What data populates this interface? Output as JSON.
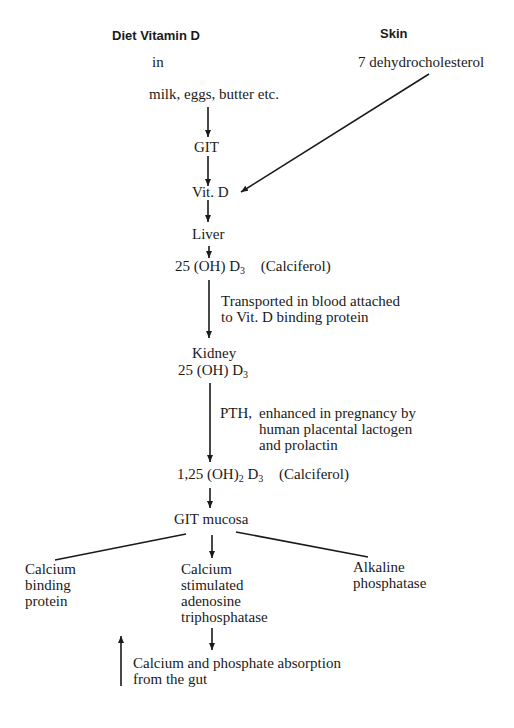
{
  "diagram": {
    "headers": {
      "diet": "Diet Vitamin D",
      "skin": "Skin"
    },
    "sources": {
      "in": "in",
      "foods": "milk, eggs, butter etc.",
      "skin_precursor": "7 dehydrocholesterol"
    },
    "nodes": {
      "git": "GIT",
      "vitd": "Vit. D",
      "liver": "Liver",
      "calcifediol_main": "25 (OH) D",
      "calcifediol_sub": "3",
      "calcifediol_note": "(Calciferol)",
      "kidney": "Kidney",
      "kidney_compound_main": "25 (OH) D",
      "kidney_compound_sub": "3",
      "calcitriol_prefix": "1,25 (OH)",
      "calcitriol_sub1": "2",
      "calcitriol_mid": " D",
      "calcitriol_sub2": "3",
      "calcitriol_note": "(Calciferol)",
      "git_mucosa": "GIT mucosa",
      "cbp": "Calcium\nbinding\nprotein",
      "atpase": "Calcium\nstimulated\nadenosine\ntriphosphatase",
      "alp": "Alkaline\nphosphatase",
      "absorption": "Calcium and phosphate absorption\nfrom the gut"
    },
    "edge_labels": {
      "transport": "Transported in blood attached\nto Vit. D binding protein",
      "pth": "PTH,",
      "pth_detail": "enhanced in pregnancy by\nhuman placental lactogen\nand prolactin"
    },
    "colors": {
      "ink": "#1a1a1a",
      "background": "#ffffff"
    }
  }
}
